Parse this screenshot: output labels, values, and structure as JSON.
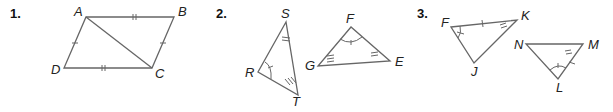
{
  "problems": [
    {
      "number": "1.",
      "figure": "parallelogram-with-diagonal",
      "vertices": {
        "A": "A",
        "B": "B",
        "C": "C",
        "D": "D"
      },
      "markings": [
        "AB and DC marked with double ticks",
        "AD and BC marked with single ticks",
        "diagonal AC"
      ]
    },
    {
      "number": "2.",
      "figure": "two-triangles",
      "triangle1": {
        "S": "S",
        "R": "R",
        "T": "T"
      },
      "triangle2": {
        "F": "F",
        "G": "G",
        "E": "E"
      },
      "markings": [
        "angle R single arc tick",
        "angle S double tick",
        "angle T triple tick",
        "angle F single arc tick",
        "angle G triple tick",
        "angle E double tick"
      ]
    },
    {
      "number": "3.",
      "figure": "two-triangles",
      "triangle1": {
        "F": "F",
        "K": "K",
        "J": "J"
      },
      "triangle2": {
        "N": "N",
        "M": "M",
        "L": "L"
      },
      "markings": [
        "side FK single tick",
        "angle F single tick",
        "angle K double tick",
        "side ML single tick",
        "angle M double tick",
        "angle L single tick"
      ]
    }
  ]
}
